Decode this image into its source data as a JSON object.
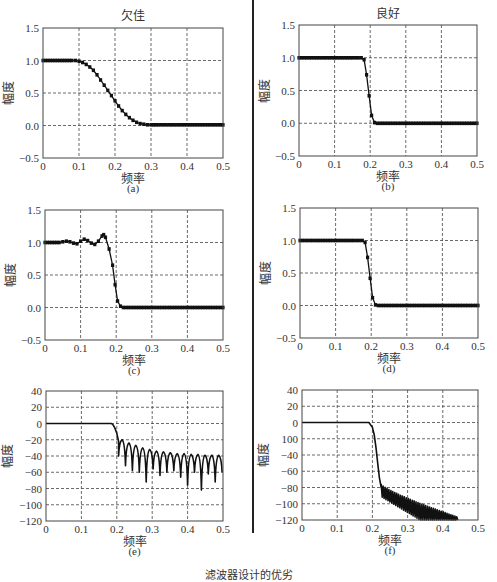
{
  "figure": {
    "column_titles": [
      "欠佳",
      "良好"
    ],
    "bottom_caption": "滤波器设计的优劣"
  },
  "chart_data": [
    {
      "id": "a",
      "panel_label": "(a)",
      "title": "欠佳",
      "type": "line",
      "xlabel": "频率",
      "ylabel": "幅度",
      "xlim": [
        0,
        0.5
      ],
      "ylim": [
        -0.5,
        1.5
      ],
      "xticks": [
        0,
        0.1,
        0.2,
        0.3,
        0.4,
        0.5
      ],
      "xtick_labels": [
        "0",
        "0.1",
        "0.2",
        "0.3",
        "0.4",
        "0.5"
      ],
      "yticks": [
        -0.5,
        0,
        0.5,
        1,
        1.5
      ],
      "ytick_labels": [
        "−0.5",
        "0.0",
        "0.5",
        "1.0",
        "1.5"
      ],
      "grid": true,
      "markers": true,
      "x": [
        0,
        0.02,
        0.04,
        0.06,
        0.08,
        0.09,
        0.1,
        0.11,
        0.12,
        0.13,
        0.14,
        0.15,
        0.16,
        0.17,
        0.18,
        0.19,
        0.2,
        0.21,
        0.22,
        0.23,
        0.24,
        0.25,
        0.26,
        0.27,
        0.28,
        0.29,
        0.3,
        0.32,
        0.35,
        0.4,
        0.45,
        0.5
      ],
      "y": [
        1,
        1,
        1,
        1,
        1,
        1,
        0.99,
        0.97,
        0.94,
        0.9,
        0.85,
        0.78,
        0.7,
        0.62,
        0.54,
        0.46,
        0.38,
        0.3,
        0.23,
        0.17,
        0.12,
        0.08,
        0.05,
        0.03,
        0.02,
        0.01,
        0.01,
        0.01,
        0.01,
        0.01,
        0.01,
        0.01
      ]
    },
    {
      "id": "b",
      "panel_label": "(b)",
      "title": "良好",
      "type": "line",
      "xlabel": "频率",
      "ylabel": "幅度",
      "xlim": [
        0,
        0.5
      ],
      "ylim": [
        -0.5,
        1.5
      ],
      "xticks": [
        0,
        0.1,
        0.2,
        0.3,
        0.4,
        0.5
      ],
      "xtick_labels": [
        "0",
        "0.1",
        "0.2",
        "0.3",
        "0.4",
        "0.5"
      ],
      "yticks": [
        -0.5,
        0,
        0.5,
        1,
        1.5
      ],
      "ytick_labels": [
        "−0.5",
        "0.0",
        "0.5",
        "1.0",
        "1.5"
      ],
      "grid": true,
      "markers": true,
      "x": [
        0,
        0.05,
        0.1,
        0.15,
        0.175,
        0.183,
        0.19,
        0.197,
        0.204,
        0.212,
        0.22,
        0.3,
        0.4,
        0.5
      ],
      "y": [
        1,
        1,
        1,
        1,
        1,
        0.97,
        0.74,
        0.42,
        0.12,
        0.01,
        0.0,
        0.0,
        0.0,
        0.0
      ]
    },
    {
      "id": "c",
      "panel_label": "(c)",
      "title": "",
      "type": "line",
      "xlabel": "频率",
      "ylabel": "幅度",
      "xlim": [
        0,
        0.5
      ],
      "ylim": [
        -0.5,
        1.5
      ],
      "xticks": [
        0,
        0.1,
        0.2,
        0.3,
        0.4,
        0.5
      ],
      "xtick_labels": [
        "0",
        "0.1",
        "0.2",
        "0.3",
        "0.4",
        "0.5"
      ],
      "yticks": [
        -0.5,
        0,
        0.5,
        1,
        1.5
      ],
      "ytick_labels": [
        "−0.5",
        "0.0",
        "0.5",
        "1.0",
        "1.5"
      ],
      "grid": true,
      "markers": true,
      "x": [
        0,
        0.02,
        0.04,
        0.05,
        0.06,
        0.07,
        0.08,
        0.09,
        0.1,
        0.11,
        0.12,
        0.13,
        0.14,
        0.15,
        0.16,
        0.165,
        0.17,
        0.18,
        0.19,
        0.197,
        0.204,
        0.212,
        0.22,
        0.3,
        0.4,
        0.5
      ],
      "y": [
        1,
        1,
        1,
        1.01,
        1.02,
        1.01,
        0.99,
        0.98,
        1.02,
        1.05,
        1.03,
        0.99,
        0.97,
        1.02,
        1.1,
        1.12,
        1.08,
        0.9,
        0.65,
        0.35,
        0.1,
        0.02,
        0.0,
        0.0,
        0.0,
        0.0
      ]
    },
    {
      "id": "d",
      "panel_label": "(d)",
      "title": "",
      "type": "line",
      "xlabel": "频率",
      "ylabel": "幅度",
      "xlim": [
        0,
        0.5
      ],
      "ylim": [
        -0.5,
        1.5
      ],
      "xticks": [
        0,
        0.1,
        0.2,
        0.3,
        0.4,
        0.5
      ],
      "xtick_labels": [
        "0",
        "0.1",
        "0.2",
        "0.3",
        "0.4",
        "0.5"
      ],
      "yticks": [
        -0.5,
        0,
        0.5,
        1,
        1.5
      ],
      "ytick_labels": [
        "−0.5",
        "0.0",
        "0.5",
        "1.0",
        "1.5"
      ],
      "grid": true,
      "markers": true,
      "x": [
        0,
        0.05,
        0.1,
        0.15,
        0.175,
        0.183,
        0.19,
        0.197,
        0.204,
        0.212,
        0.22,
        0.3,
        0.4,
        0.5
      ],
      "y": [
        1,
        1,
        1,
        1,
        1,
        0.97,
        0.74,
        0.42,
        0.12,
        0.01,
        0.0,
        0.0,
        0.0,
        0.0
      ]
    },
    {
      "id": "e",
      "panel_label": "(e)",
      "title": "",
      "type": "line",
      "xlabel": "频率",
      "ylabel": "幅度",
      "xlim": [
        0,
        0.5
      ],
      "ylim": [
        -120,
        40
      ],
      "xticks": [
        0,
        0.1,
        0.2,
        0.3,
        0.4,
        0.5
      ],
      "xtick_labels": [
        "0",
        "0.1",
        "0.2",
        "0.3",
        "0.4",
        "0.5"
      ],
      "yticks": [
        -120,
        -100,
        -80,
        -60,
        -40,
        -20,
        0,
        20,
        40
      ],
      "ytick_labels": [
        "−120",
        "−100",
        "−80",
        "−60",
        "−40",
        "−20",
        "0",
        "20",
        "40"
      ],
      "grid": true,
      "markers": false,
      "passband": {
        "x_end": 0.185,
        "level": 0
      },
      "transition": {
        "x": [
          0.185,
          0.19,
          0.195,
          0.2,
          0.205
        ],
        "y": [
          0,
          -2,
          -6,
          -12,
          -22
        ]
      },
      "sidelobes": {
        "start": 0.205,
        "spacing": 0.0195,
        "peaks": [
          -20,
          -24,
          -27,
          -30,
          -32,
          -34,
          -35,
          -36,
          -37,
          -37,
          -38,
          -38,
          -39,
          -39,
          -39,
          -40
        ],
        "nulls": [
          -40,
          -52,
          -58,
          -60,
          -72,
          -56,
          -64,
          -60,
          -58,
          -66,
          -76,
          -60,
          -82,
          -62,
          -72,
          -60,
          -68
        ]
      }
    },
    {
      "id": "f",
      "panel_label": "(f)",
      "title": "",
      "type": "line",
      "xlabel": "频率",
      "ylabel": "幅度",
      "xlim": [
        0,
        0.5
      ],
      "ylim": [
        -120,
        40
      ],
      "xticks": [
        0,
        0.1,
        0.2,
        0.3,
        0.4,
        0.5
      ],
      "xtick_labels": [
        "0",
        "0.1",
        "0.2",
        "0.3",
        "0.4",
        "0.5"
      ],
      "yticks": [
        -120,
        -100,
        -80,
        -60,
        -40,
        -20,
        0,
        20,
        40
      ],
      "ytick_labels": [
        "−120",
        "−100",
        "−80",
        "−60",
        "−40",
        "100",
        "0",
        "20",
        "40"
      ],
      "grid": true,
      "markers": false,
      "passband": {
        "x_end": 0.19,
        "level": 0
      },
      "transition": {
        "x": [
          0.19,
          0.2,
          0.205,
          0.21,
          0.215,
          0.22,
          0.225
        ],
        "y": [
          0,
          -6,
          -15,
          -30,
          -50,
          -68,
          -80
        ]
      },
      "sidelobes": {
        "start": 0.225,
        "spacing": 0.0055,
        "peaks_start": -76,
        "peaks_end": -116,
        "end": 0.44,
        "nulls_start": -92,
        "floor": -120
      }
    }
  ]
}
